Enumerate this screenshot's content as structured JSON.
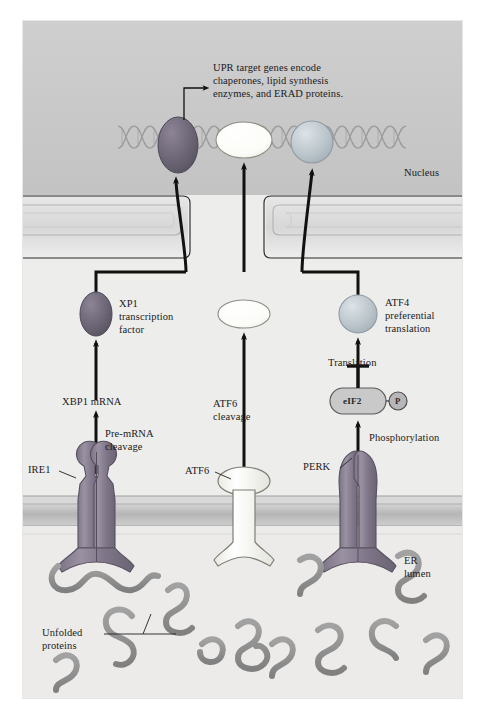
{
  "figure": {
    "title_note": "UPR target genes encode chaperones, lipid synthesis enzymes, and ERAD proteins.",
    "compartments": {
      "nucleus": "Nucleus",
      "er_lumen_line1": "ER",
      "er_lumen_line2": "lumen"
    },
    "callout": {
      "line1": "UPR target genes encode",
      "line2": "chaperones, lipid synthesis",
      "line3": "enzymes, and ERAD proteins."
    },
    "branches": {
      "ire1": {
        "sensor_label": "IRE1",
        "step_label_line1": "Pre-mRNA",
        "step_label_line2": "cleavage",
        "product_label": "XBP1 mRNA",
        "factor_line1": "XP1",
        "factor_line2": "transcription",
        "factor_line3": "factor"
      },
      "atf6": {
        "sensor_label": "ATF6",
        "step_label_line1": "ATF6",
        "step_label_line2": "cleavage"
      },
      "perk": {
        "sensor_label": "PERK",
        "step_label": "Phosphorylation",
        "complex_label": "eIF2",
        "phosphate_label": "P",
        "translation_label": "Translation",
        "factor_line1": "ATF4",
        "factor_line2": "preferential",
        "factor_line3": "translation"
      }
    },
    "unfolded": {
      "line1": "Unfolded",
      "line2": "proteins"
    },
    "colors": {
      "page_background": "#ffffff",
      "cytoplasm": "#ededec",
      "nucleoplasm": "#c9c9c9",
      "er_lumen": "#ececeb",
      "membrane_band": "#b9b9b9",
      "dna_strand": "#9a9a9a",
      "xbp1_factor": "#6f6878",
      "atf6_factor": "#fdfdfb",
      "atf4_factor": "#b9c3c9",
      "ire1_protein": "#8b8392",
      "perk_protein": "#8b8392",
      "atf6_protein": "#fbfbf8",
      "unfolded_chain": "#8e8e8e",
      "arrow": "#111111",
      "label_text": "#1b1b1b",
      "frame_border": "#e2e2e2"
    }
  }
}
